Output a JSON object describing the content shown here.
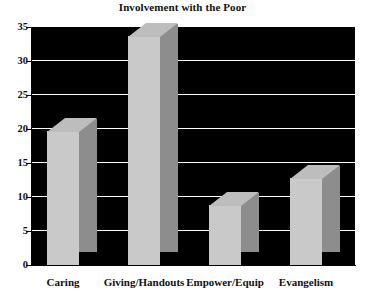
{
  "chart_data": {
    "type": "bar",
    "title": "Involvement with the Poor",
    "xlabel": "",
    "ylabel": "",
    "categories": [
      "Caring",
      "Giving/Handouts",
      "Empower/Equip",
      "Evangelism"
    ],
    "values": [
      19.5,
      33.5,
      8.7,
      12.7
    ],
    "ylim": [
      0,
      35
    ],
    "yticks": [
      0,
      5,
      10,
      15,
      20,
      25,
      30,
      35
    ],
    "ytick_labels": [
      "0",
      "5",
      "10",
      "15",
      "20",
      "25",
      "30",
      "35"
    ],
    "grid": true,
    "legend": false,
    "style": {
      "plot_background": "#000000",
      "bar_front_color": "#c9c9c9",
      "bar_side_color": "#8d8d8d",
      "bar_top_color": "#bdbdbd",
      "gridline_color": "#ffffff",
      "text_color": "#111111",
      "three_d": true
    }
  }
}
